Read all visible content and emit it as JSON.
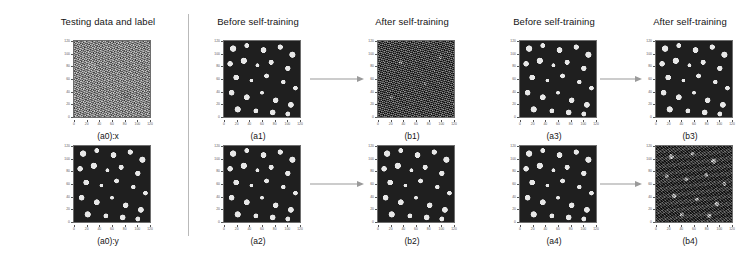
{
  "figure": {
    "headers": [
      {
        "id": "testing-data-and-label",
        "label": "Testing data and label",
        "center_x": 108
      },
      {
        "id": "before-self-training-1",
        "label": "Before self-training",
        "center_x": 258
      },
      {
        "id": "after-self-training-1",
        "label": "After self-training",
        "center_x": 412
      },
      {
        "id": "before-self-training-2",
        "label": "Before self-training",
        "center_x": 554
      },
      {
        "id": "after-self-training-2",
        "label": "After self-training",
        "center_x": 690
      }
    ],
    "divider": {
      "name": "column-divider",
      "orientation": "vertical"
    },
    "axis": {
      "xticklabels": [
        "0",
        "20",
        "40",
        "60",
        "80",
        "100",
        "120"
      ],
      "yticklabels": [
        "0",
        "20",
        "40",
        "60",
        "80",
        "100",
        "120"
      ],
      "tick_color": "#555555"
    },
    "panels": [
      {
        "id": "a0x",
        "caption": "(a0):x",
        "texture": "tex-noise",
        "description": "noisy grayscale hyperspectral test input",
        "left": 65,
        "top": 40
      },
      {
        "id": "a1",
        "caption": "(a1)",
        "texture": "tex-blob",
        "description": "binary prediction map before self-training",
        "left": 215,
        "top": 40
      },
      {
        "id": "b1",
        "caption": "(b1)",
        "texture": "tex-speckle",
        "description": "degraded speckled prediction map after self-training",
        "left": 369,
        "top": 40
      },
      {
        "id": "a3",
        "caption": "(a3)",
        "texture": "tex-blob",
        "description": "binary prediction map before self-training",
        "left": 511,
        "top": 40
      },
      {
        "id": "b3",
        "caption": "(b3)",
        "texture": "tex-blob",
        "description": "binary prediction map after self-training",
        "left": 647,
        "top": 40
      },
      {
        "id": "a0y",
        "caption": "(a0):y",
        "texture": "tex-blob",
        "description": "ground-truth binary label map",
        "left": 65,
        "top": 145
      },
      {
        "id": "a2",
        "caption": "(a2)",
        "texture": "tex-blob",
        "description": "binary prediction map before self-training",
        "left": 215,
        "top": 145
      },
      {
        "id": "b2",
        "caption": "(b2)",
        "texture": "tex-blob",
        "description": "binary prediction map after self-training",
        "left": 369,
        "top": 145
      },
      {
        "id": "a4",
        "caption": "(a4)",
        "texture": "tex-blob",
        "description": "binary prediction map before self-training",
        "left": 511,
        "top": 145
      },
      {
        "id": "b4",
        "caption": "(b4)",
        "texture": "tex-blob-noisy",
        "description": "noisy prediction map after self-training",
        "left": 647,
        "top": 145
      }
    ],
    "arrows": [
      {
        "id": "arrow-a1-b1",
        "left": 310,
        "top": 74,
        "width": 54
      },
      {
        "id": "arrow-a3-b3",
        "left": 600,
        "top": 74,
        "width": 42
      },
      {
        "id": "arrow-a2-b2",
        "left": 310,
        "top": 179,
        "width": 54
      },
      {
        "id": "arrow-a4-b4",
        "left": 600,
        "top": 179,
        "width": 42
      }
    ],
    "colors": {
      "background": "#ffffff",
      "text": "#141414",
      "divider": "#b9b9b9",
      "arrow": "#9a9a9a",
      "panel_border": "#6e6e6e"
    }
  }
}
